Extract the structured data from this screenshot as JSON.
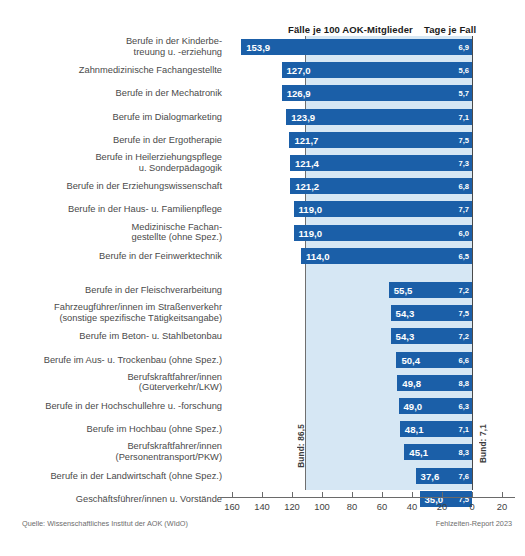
{
  "header": {
    "faelle_title": "Fälle je 100 AOK-Mitglieder",
    "tage_title": "Tage je Fall"
  },
  "annotations": {
    "bund_left": "Bund: 86,5",
    "bund_right": "Bund: 7,1"
  },
  "footer": {
    "source": "Quelle: Wissenschaftliches Institut der AOK (WIdO)",
    "report": "Fehlzeiten-Report 2023"
  },
  "chart_data": {
    "type": "bar",
    "title": "Fälle je 100 AOK-Mitglieder",
    "xlabel": "",
    "ylabel": "",
    "xlim": [
      160,
      -20
    ],
    "orientation": "horizontal-right-aligned",
    "grid": false,
    "legend": "none",
    "axis_ticks": [
      160,
      140,
      120,
      100,
      80,
      60,
      40,
      20,
      0,
      20
    ],
    "reference_lines": [
      {
        "name": "Bund Fälle je 100 AOK-Mitglieder",
        "value": 86.5,
        "label": "Bund: 86,5"
      },
      {
        "name": "Bund Tage je Fall",
        "value": 7.1,
        "label": "Bund: 7,1"
      }
    ],
    "series": [
      {
        "name": "Fälle je 100 AOK-Mitglieder",
        "color": "#1b5fa8"
      },
      {
        "name": "Tage je Fall",
        "color": "#1b5fa8"
      }
    ],
    "groups": [
      {
        "name": "Berufsgruppen mit den meisten Arbeitsunfähigkeitsfällen",
        "rows": [
          {
            "category": "Berufe in der Kinderbe-\ntreuung u. -erziehung",
            "faelle": 153.9,
            "faelle_label": "153,9",
            "tage": 6.9,
            "tage_label": "6,9"
          },
          {
            "category": "Zahnmedizinische Fachangestellte",
            "faelle": 127.0,
            "faelle_label": "127,0",
            "tage": 5.6,
            "tage_label": "5,6"
          },
          {
            "category": "Berufe in der Mechatronik",
            "faelle": 126.9,
            "faelle_label": "126,9",
            "tage": 5.7,
            "tage_label": "5,7"
          },
          {
            "category": "Berufe im Dialogmarketing",
            "faelle": 123.9,
            "faelle_label": "123,9",
            "tage": 7.1,
            "tage_label": "7,1"
          },
          {
            "category": "Berufe in der Ergotherapie",
            "faelle": 121.7,
            "faelle_label": "121,7",
            "tage": 7.5,
            "tage_label": "7,5"
          },
          {
            "category": "Berufe in Heilerziehungspflege\nu. Sonderpädagogik",
            "faelle": 121.4,
            "faelle_label": "121,4",
            "tage": 7.3,
            "tage_label": "7,3"
          },
          {
            "category": "Berufe in der Erziehungswissenschaft",
            "faelle": 121.2,
            "faelle_label": "121,2",
            "tage": 6.8,
            "tage_label": "6,8"
          },
          {
            "category": "Berufe in der Haus- u. Familienpflege",
            "faelle": 119.0,
            "faelle_label": "119,0",
            "tage": 7.7,
            "tage_label": "7,7"
          },
          {
            "category": "Medizinische Fachan-\ngestellte (ohne Spez.)",
            "faelle": 119.0,
            "faelle_label": "119,0",
            "tage": 6.0,
            "tage_label": "6,0"
          },
          {
            "category": "Berufe in der Feinwerktechnik",
            "faelle": 114.0,
            "faelle_label": "114,0",
            "tage": 6.5,
            "tage_label": "6,5"
          }
        ]
      },
      {
        "name": "Berufsgruppen mit den wenigsten Arbeitsunfähigkeitsfällen",
        "rows": [
          {
            "category": "Berufe in der Fleischverarbeitung",
            "faelle": 55.5,
            "faelle_label": "55,5",
            "tage": 7.2,
            "tage_label": "7,2"
          },
          {
            "category": "Fahrzeugführer/innen im Straßenverkehr\n(sonstige spezifische Tätigkeitsangabe)",
            "faelle": 54.3,
            "faelle_label": "54,3",
            "tage": 7.5,
            "tage_label": "7,5"
          },
          {
            "category": "Berufe im Beton- u. Stahlbetonbau",
            "faelle": 54.3,
            "faelle_label": "54,3",
            "tage": 7.2,
            "tage_label": "7,2"
          },
          {
            "category": "Berufe im Aus- u. Trockenbau (ohne Spez.)",
            "faelle": 50.4,
            "faelle_label": "50,4",
            "tage": 6.6,
            "tage_label": "6,6"
          },
          {
            "category": "Berufskraftfahrer/innen\n(Güterverkehr/LKW)",
            "faelle": 49.8,
            "faelle_label": "49,8",
            "tage": 8.8,
            "tage_label": "8,8"
          },
          {
            "category": "Berufe in der Hochschullehre u. -forschung",
            "faelle": 49.0,
            "faelle_label": "49,0",
            "tage": 6.3,
            "tage_label": "6,3"
          },
          {
            "category": "Berufe im Hochbau (ohne Spez.)",
            "faelle": 48.1,
            "faelle_label": "48,1",
            "tage": 7.1,
            "tage_label": "7,1"
          },
          {
            "category": "Berufskraftfahrer/innen\n(Personentransport/PKW)",
            "faelle": 45.1,
            "faelle_label": "45,1",
            "tage": 8.3,
            "tage_label": "8,3"
          },
          {
            "category": "Berufe in der Landwirtschaft (ohne Spez.)",
            "faelle": 37.6,
            "faelle_label": "37,6",
            "tage": 7.6,
            "tage_label": "7,6"
          },
          {
            "category": "Geschäftsführer/innen u. Vorstände",
            "faelle": 35.0,
            "faelle_label": "35,0",
            "tage": 7.5,
            "tage_label": "7,5"
          }
        ]
      }
    ]
  }
}
